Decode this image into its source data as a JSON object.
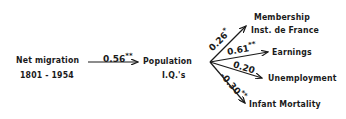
{
  "nodes": {
    "source": {
      "line1": "Net migration",
      "line2": "1801 - 1954"
    },
    "mediator": {
      "line1": "Population",
      "line2": "I.Q.'s"
    },
    "outcomes": [
      {
        "line1": "Membership",
        "line2": "Inst. de France"
      },
      {
        "line1": "Earnings"
      },
      {
        "line1": "Unemployment"
      },
      {
        "line1": "Infant Mortality"
      }
    ]
  },
  "edges": {
    "main": {
      "coef": "0.56",
      "sig": "**"
    },
    "outcomes": [
      {
        "coef": "0.26",
        "sig": "*"
      },
      {
        "coef": "0.61",
        "sig": "**"
      },
      {
        "coef": "0.20",
        "sig": ""
      },
      {
        "coef": "-0.30",
        "sig": "**"
      }
    ]
  }
}
